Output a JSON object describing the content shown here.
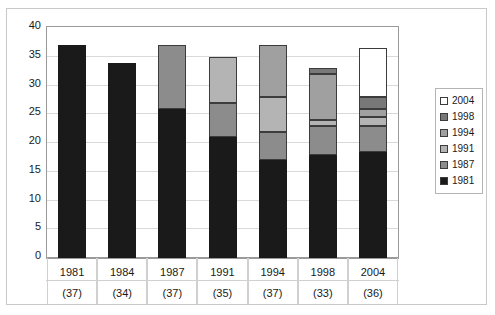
{
  "chart_data": {
    "type": "bar",
    "subtype": "stacked-vertical",
    "title": "",
    "xlabel": "",
    "ylabel": "",
    "ylim": [
      0,
      40
    ],
    "ytick_step": 5,
    "yticks": [
      40,
      35,
      30,
      25,
      20,
      15,
      10,
      5,
      0
    ],
    "grid": true,
    "legend_position": "right",
    "categories": [
      "1981",
      "1984",
      "1987",
      "1991",
      "1994",
      "1998",
      "2004"
    ],
    "category_counts": [
      "(37)",
      "(34)",
      "(37)",
      "(35)",
      "(37)",
      "(33)",
      "(36)"
    ],
    "totals": [
      37,
      34,
      37,
      35,
      37,
      33,
      36.5
    ],
    "series": [
      {
        "name": "1981",
        "color": "#1a1a1a",
        "values": [
          37,
          34,
          26,
          21,
          17,
          18,
          18.5
        ]
      },
      {
        "name": "1987",
        "color": "#8c8c8c",
        "values": [
          0,
          0,
          11,
          6,
          5,
          5,
          4.5
        ]
      },
      {
        "name": "1991",
        "color": "#b4b4b4",
        "values": [
          0,
          0,
          0,
          8,
          6,
          1,
          1.5
        ]
      },
      {
        "name": "1994",
        "color": "#a0a0a0",
        "values": [
          0,
          0,
          0,
          0,
          9,
          8,
          1.5
        ]
      },
      {
        "name": "1998",
        "color": "#787878",
        "values": [
          0,
          0,
          0,
          0,
          0,
          1,
          2
        ]
      },
      {
        "name": "2004",
        "color": "#ffffff",
        "values": [
          0,
          0,
          0,
          0,
          0,
          0,
          8.5
        ]
      }
    ]
  },
  "legend": {
    "entries": [
      {
        "label": "2004",
        "color": "#ffffff"
      },
      {
        "label": "1998",
        "color": "#787878"
      },
      {
        "label": "1994",
        "color": "#a0a0a0"
      },
      {
        "label": "1991",
        "color": "#b4b4b4"
      },
      {
        "label": "1987",
        "color": "#8c8c8c"
      },
      {
        "label": "1981",
        "color": "#1a1a1a"
      }
    ]
  },
  "axes": {
    "y_labels": [
      "40",
      "35",
      "30",
      "25",
      "20",
      "15",
      "10",
      "5",
      "0"
    ]
  }
}
